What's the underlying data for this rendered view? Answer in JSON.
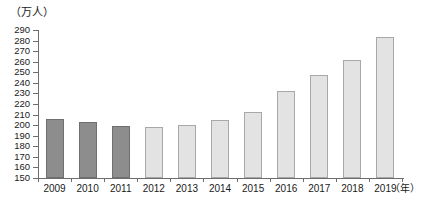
{
  "chart_data": {
    "type": "bar",
    "title": "",
    "subtitle": "",
    "unit_label": "（万人）",
    "xlabel": "（年）",
    "ylabel": "",
    "categories": [
      "2009",
      "2010",
      "2011",
      "2012",
      "2013",
      "2014",
      "2015",
      "2016",
      "2017",
      "2018",
      "2019"
    ],
    "values": [
      206,
      203,
      199,
      198,
      200,
      205,
      212,
      232,
      247,
      262,
      283
    ],
    "ylim": [
      150,
      290
    ],
    "ytick_step": 10,
    "ytick_labels": [
      "290",
      "280",
      "270",
      "260",
      "250",
      "240",
      "230",
      "220",
      "210",
      "200",
      "190",
      "180",
      "170",
      "160",
      "150"
    ],
    "grid": false,
    "legend": null,
    "series": [
      {
        "name": "人数",
        "values": [
          206,
          203,
          199,
          198,
          200,
          205,
          212,
          232,
          247,
          262,
          283
        ]
      }
    ],
    "bar_styles": [
      "dark",
      "dark",
      "dark",
      "light",
      "light",
      "light",
      "light",
      "light",
      "light",
      "light",
      "light"
    ],
    "colors": {
      "bar_dark_fill": "#8d8d8d",
      "bar_dark_border": "#6f6f6f",
      "bar_light_fill": "#e3e3e3",
      "bar_light_border": "#a8a8a8",
      "axis": "#6d6d6d",
      "text": "#1a1a1a",
      "background": "#ffffff"
    }
  }
}
